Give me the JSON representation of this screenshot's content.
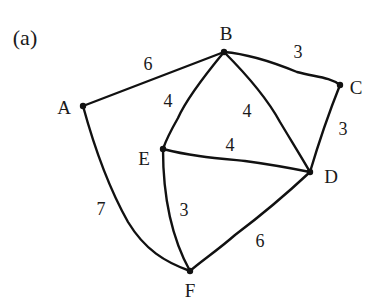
{
  "panel_label": "(a)",
  "graph": {
    "nodes": [
      {
        "id": "A",
        "label": "A"
      },
      {
        "id": "B",
        "label": "B"
      },
      {
        "id": "C",
        "label": "C"
      },
      {
        "id": "D",
        "label": "D"
      },
      {
        "id": "E",
        "label": "E"
      },
      {
        "id": "F",
        "label": "F"
      }
    ],
    "edges": [
      {
        "from": "A",
        "to": "B",
        "weight": "6"
      },
      {
        "from": "B",
        "to": "C",
        "weight": "3"
      },
      {
        "from": "C",
        "to": "D",
        "weight": "3"
      },
      {
        "from": "B",
        "to": "E",
        "weight": "4"
      },
      {
        "from": "B",
        "to": "D",
        "weight": "4"
      },
      {
        "from": "E",
        "to": "D",
        "weight": "4"
      },
      {
        "from": "E",
        "to": "F",
        "weight": "3"
      },
      {
        "from": "A",
        "to": "F",
        "weight": "7"
      },
      {
        "from": "D",
        "to": "F",
        "weight": "6"
      }
    ]
  },
  "colors": {
    "stroke": "#111111",
    "background": "#ffffff"
  }
}
